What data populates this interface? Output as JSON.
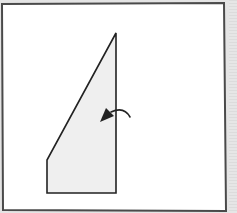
{
  "diagram": {
    "type": "paper-folding-step",
    "colors": {
      "background": "#e4e4e4",
      "paper": "#ffffff",
      "paper_border": "#4a4a4a",
      "flap_fill": "#efefef",
      "flap_stroke": "#222222",
      "arrow": "#222222"
    },
    "sheet": {
      "x": 2,
      "y": 3,
      "width": 224,
      "height": 207
    },
    "flap_polygon": [
      [
        116,
        33
      ],
      [
        116,
        193
      ],
      [
        47,
        193
      ],
      [
        47,
        160
      ]
    ],
    "arrow": {
      "direction": "fold-left",
      "path": "M 130 118 Q 122 106 108 114",
      "head": [
        101,
        122
      ]
    }
  }
}
